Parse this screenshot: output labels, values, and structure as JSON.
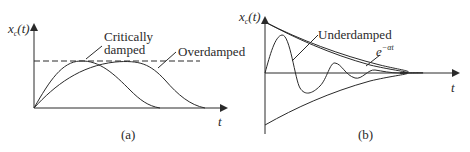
{
  "panel_a": {
    "y_axis_label_var": "x",
    "y_axis_label_sub": "c",
    "y_axis_label_arg": "(t)",
    "x_axis_label": "t",
    "curve_label_critical_line1": "Critically",
    "curve_label_critical_line2": "damped",
    "curve_label_over": "Overdamped",
    "caption": "(a)"
  },
  "panel_b": {
    "y_axis_label_var": "x",
    "y_axis_label_sub": "c",
    "y_axis_label_arg": "(t)",
    "x_axis_label": "t",
    "curve_label_under": "Underdamped",
    "envelope_label_base": "e",
    "envelope_label_exp": "−αt",
    "caption": "(b)"
  },
  "colors": {
    "ink": "#2a2a2a",
    "background": "#ffffff"
  }
}
